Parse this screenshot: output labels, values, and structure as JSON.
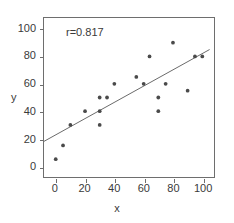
{
  "chart_data": {
    "type": "scatter",
    "title": "",
    "xlabel": "x",
    "ylabel": "y",
    "xlim": [
      -8,
      108
    ],
    "ylim": [
      -8,
      108
    ],
    "xticks": [
      0,
      20,
      40,
      60,
      80,
      100
    ],
    "yticks": [
      0,
      20,
      40,
      60,
      80,
      100
    ],
    "grid": false,
    "legend": null,
    "annotations": [
      {
        "text": "r=0.817",
        "x": 12,
        "y": 93
      }
    ],
    "points": [
      {
        "x": 0,
        "y": 5
      },
      {
        "x": 5,
        "y": 15
      },
      {
        "x": 10,
        "y": 30
      },
      {
        "x": 20,
        "y": 40
      },
      {
        "x": 30,
        "y": 50
      },
      {
        "x": 30,
        "y": 40
      },
      {
        "x": 30,
        "y": 30
      },
      {
        "x": 35,
        "y": 50
      },
      {
        "x": 40,
        "y": 60
      },
      {
        "x": 55,
        "y": 65
      },
      {
        "x": 60,
        "y": 60
      },
      {
        "x": 64,
        "y": 80
      },
      {
        "x": 70,
        "y": 50
      },
      {
        "x": 70,
        "y": 40
      },
      {
        "x": 75,
        "y": 60
      },
      {
        "x": 80,
        "y": 90
      },
      {
        "x": 90,
        "y": 55
      },
      {
        "x": 95,
        "y": 80
      },
      {
        "x": 100,
        "y": 80
      }
    ],
    "fit_line": {
      "x_start": -8,
      "y_start": 18,
      "x_end": 105,
      "y_end": 85
    },
    "colors": {
      "point": "#4a4a4a",
      "line": "#6b6b6b",
      "frame": "#6e6e6e",
      "text": "#3a3a3a",
      "background": "#ffffff"
    }
  }
}
